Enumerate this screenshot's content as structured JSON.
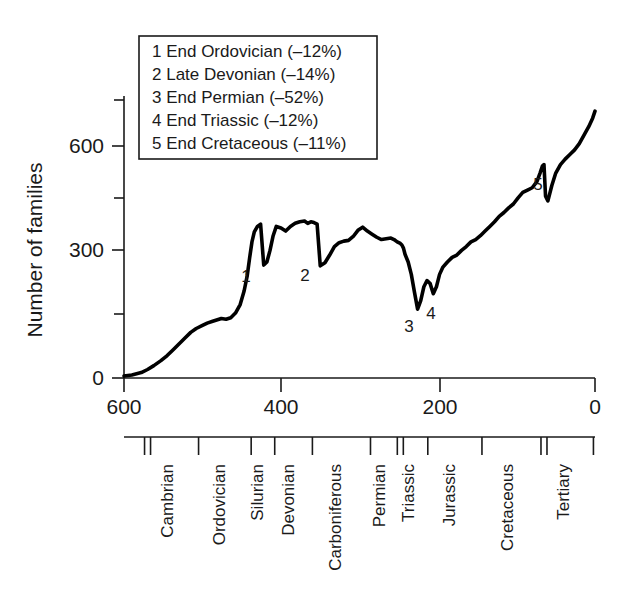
{
  "chart_data": {
    "type": "line",
    "title": "",
    "xlabel": "",
    "ylabel": "Number of families",
    "xlim": [
      600,
      0
    ],
    "ylim": [
      0,
      700
    ],
    "x_ticks": [
      600,
      400,
      200,
      0
    ],
    "x_tick_labels": [
      "600",
      "400",
      "200",
      "0"
    ],
    "x_minor_ticks": [
      500,
      300,
      100
    ],
    "y_ticks": [
      0,
      300,
      600
    ],
    "y_tick_labels": [
      "0",
      "300",
      "600"
    ],
    "y_minor_ticks": [
      150,
      450,
      700
    ],
    "grid": false,
    "legend_position": "upper-left",
    "x_axis_direction": "reversed",
    "x_axis_units": "millions of years ago",
    "series": [
      {
        "name": "Marine family diversity",
        "x": [
          600,
          590,
          578,
          570,
          562,
          553,
          545,
          538,
          530,
          522,
          515,
          508,
          500,
          494,
          488,
          482,
          476,
          470,
          464,
          458,
          452,
          447,
          443,
          440,
          437,
          434,
          430,
          426,
          422,
          418,
          414,
          410,
          406,
          400,
          394,
          388,
          382,
          376,
          370,
          366,
          362,
          358,
          354,
          350,
          344,
          338,
          332,
          326,
          320,
          314,
          308,
          302,
          296,
          290,
          284,
          278,
          272,
          266,
          260,
          256,
          252,
          250,
          248,
          246,
          244,
          242,
          238,
          234,
          230,
          226,
          222,
          218,
          214,
          210,
          206,
          202,
          198,
          194,
          188,
          182,
          176,
          170,
          164,
          158,
          152,
          146,
          140,
          134,
          128,
          122,
          116,
          110,
          104,
          98,
          92,
          86,
          80,
          74,
          70,
          67,
          65,
          63,
          60,
          55,
          50,
          44,
          38,
          32,
          26,
          20,
          14,
          8,
          3,
          0
        ],
        "y": [
          5,
          8,
          14,
          22,
          32,
          45,
          58,
          72,
          88,
          104,
          118,
          128,
          136,
          142,
          146,
          150,
          154,
          152,
          156,
          168,
          190,
          225,
          265,
          310,
          352,
          378,
          392,
          398,
          292,
          300,
          330,
          368,
          392,
          388,
          380,
          392,
          400,
          404,
          406,
          400,
          404,
          402,
          398,
          290,
          298,
          318,
          340,
          350,
          354,
          356,
          366,
          382,
          390,
          380,
          372,
          364,
          358,
          360,
          362,
          358,
          352,
          350,
          348,
          344,
          336,
          320,
          300,
          268,
          222,
          178,
          200,
          236,
          252,
          244,
          218,
          236,
          268,
          286,
          300,
          312,
          318,
          330,
          340,
          352,
          358,
          368,
          380,
          392,
          404,
          418,
          428,
          440,
          450,
          466,
          480,
          486,
          492,
          508,
          530,
          548,
          552,
          470,
          458,
          498,
          530,
          552,
          566,
          578,
          590,
          606,
          628,
          650,
          672,
          690
        ]
      }
    ],
    "event_markers": [
      {
        "id": "1",
        "label": "End Ordovician",
        "drop_percent": -12,
        "x": 440,
        "y": 292
      },
      {
        "id": "2",
        "label": "Late Devonian",
        "drop_percent": -14,
        "x": 362,
        "y": 290
      },
      {
        "id": "3",
        "label": "End Permian",
        "drop_percent": -52,
        "x": 250,
        "y": 178
      },
      {
        "id": "4",
        "label": "End Triassic",
        "drop_percent": -12,
        "x": 208,
        "y": 218
      },
      {
        "id": "5",
        "label": "End Cretaceous",
        "drop_percent": -11,
        "x": 65,
        "y": 470
      }
    ],
    "geologic_periods": [
      {
        "name": "Cambrian",
        "start": 570,
        "end": 505
      },
      {
        "name": "Ordovician",
        "start": 505,
        "end": 438
      },
      {
        "name": "Silurian",
        "start": 438,
        "end": 408
      },
      {
        "name": "Devonian",
        "start": 408,
        "end": 360
      },
      {
        "name": "Carboniferous",
        "start": 360,
        "end": 286
      },
      {
        "name": "Permian",
        "start": 286,
        "end": 248
      },
      {
        "name": "Triassic",
        "start": 248,
        "end": 213
      },
      {
        "name": "Jurassic",
        "start": 213,
        "end": 144
      },
      {
        "name": "Cretaceous",
        "start": 144,
        "end": 65
      },
      {
        "name": "Tertiary",
        "start": 65,
        "end": 2
      }
    ],
    "era_boundaries": [
      570,
      248,
      65
    ]
  },
  "legend": {
    "entries": [
      "1 End Ordovician (–12%)",
      "2 Late Devonian (–14%)",
      "3 End Permian (–52%)",
      "4 End Triassic (–12%)",
      "5 End Cretaceous (–11%)"
    ]
  },
  "axes": {
    "y_title": "Number of families",
    "y_labels": [
      "600",
      "300",
      "0"
    ],
    "x_labels": [
      "600",
      "400",
      "200",
      "0"
    ]
  },
  "periods": {
    "labels": [
      "Cambrian",
      "Ordovician",
      "Silurian",
      "Devonian",
      "Carboniferous",
      "Permian",
      "Triassic",
      "Jurassic",
      "Cretaceous",
      "Tertiary"
    ]
  },
  "markers": {
    "ids": [
      "1",
      "2",
      "3",
      "4",
      "5"
    ]
  },
  "colors": {
    "curve": "#000000",
    "axis": "#1a1a1a",
    "background": "#ffffff"
  }
}
